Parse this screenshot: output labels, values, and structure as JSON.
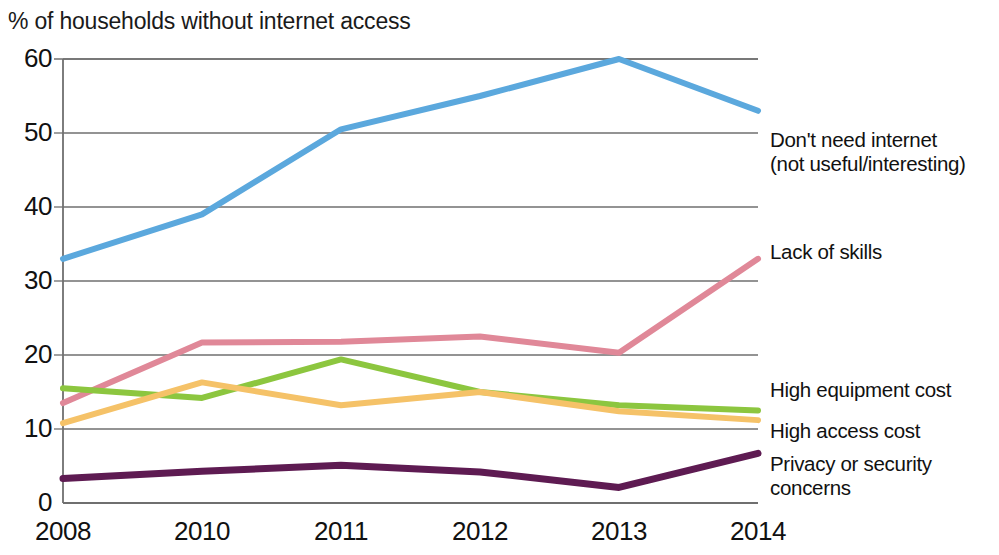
{
  "chart_data": {
    "type": "line",
    "title": "% of households without internet access",
    "xlabel": "",
    "ylabel": "",
    "categories": [
      "2008",
      "2010",
      "2011",
      "2012",
      "2013",
      "2014"
    ],
    "yticks": [
      0,
      10,
      20,
      30,
      40,
      50,
      60
    ],
    "ylim": [
      0,
      60
    ],
    "grid": true,
    "legend_position": "right-of-plot (direct line labels)",
    "series": [
      {
        "name": "Don't need internet (not useful/interesting)",
        "label_lines": [
          "Don't need internet",
          "(not useful/interesting)"
        ],
        "color": "#5BA8DD",
        "values": [
          33,
          39,
          50.5,
          55,
          60,
          53
        ]
      },
      {
        "name": "Lack of skills",
        "label_lines": [
          "Lack of skills"
        ],
        "color": "#E08898",
        "values": [
          13.5,
          21.7,
          21.8,
          22.5,
          20.3,
          33
        ]
      },
      {
        "name": "High equipment cost",
        "label_lines": [
          "High equipment cost"
        ],
        "color": "#8CC63F",
        "values": [
          15.5,
          14.2,
          19.4,
          15.0,
          13.2,
          12.5
        ]
      },
      {
        "name": "High access cost",
        "label_lines": [
          "High access cost"
        ],
        "color": "#F5C268",
        "values": [
          10.8,
          16.3,
          13.2,
          15.0,
          12.4,
          11.2
        ]
      },
      {
        "name": "Privacy or security concerns",
        "label_lines": [
          "Privacy or security",
          "concerns"
        ],
        "color": "#5E1B52",
        "values": [
          3.3,
          4.3,
          5.1,
          4.2,
          2.1,
          6.7
        ]
      }
    ]
  },
  "axis": {
    "y_tick_labels": [
      "60",
      "50",
      "40",
      "30",
      "20",
      "10",
      "0"
    ],
    "x_tick_labels": [
      "2008",
      "2010",
      "2011",
      "2012",
      "2013",
      "2014"
    ]
  },
  "legend": {
    "items": [
      {
        "text": "Don't need internet\n(not useful/interesting)"
      },
      {
        "text": "Lack of skills"
      },
      {
        "text": "High equipment cost"
      },
      {
        "text": "High access cost"
      },
      {
        "text": "Privacy or security\nconcerns"
      }
    ]
  }
}
